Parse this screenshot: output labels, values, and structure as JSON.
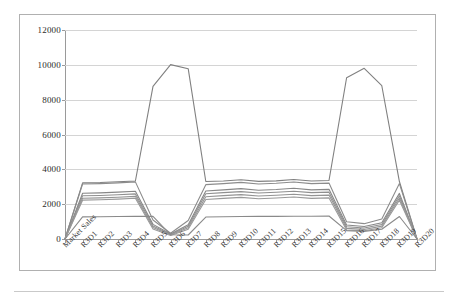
{
  "chart_data": {
    "type": "line",
    "title": "",
    "xlabel": "",
    "ylabel": "",
    "ylim": [
      0,
      12000
    ],
    "y_ticks": [
      0,
      2000,
      4000,
      6000,
      8000,
      10000,
      12000
    ],
    "grid": true,
    "legend": "none",
    "categories": [
      "Market Sales",
      "R3D1",
      "R3D2",
      "R3D3",
      "R3D4",
      "R3D5",
      "R3D6",
      "R3D7",
      "R3D8",
      "R3D9",
      "R3D10",
      "R3D11",
      "R3D12",
      "R3D13",
      "R3D14",
      "R3D15",
      "R3D16",
      "R3D17",
      "R3D18",
      "R3D19",
      "R3D20"
    ],
    "series": [
      {
        "name": "Series 1",
        "color": "#808080",
        "values": [
          0,
          3220,
          3240,
          3290,
          3330,
          8760,
          10010,
          9780,
          3300,
          3330,
          3400,
          3310,
          3340,
          3420,
          3330,
          3360,
          9260,
          9800,
          8800,
          3300,
          0
        ]
      },
      {
        "name": "Series 2",
        "color": "#8c8c8c",
        "values": [
          0,
          3160,
          3180,
          3220,
          3280,
          1090,
          330,
          1060,
          3120,
          3180,
          3250,
          3160,
          3200,
          3270,
          3180,
          3210,
          990,
          880,
          1150,
          3180,
          0
        ]
      },
      {
        "name": "Series 3",
        "color": "#878787",
        "values": [
          0,
          2630,
          2650,
          2690,
          2740,
          840,
          290,
          820,
          2760,
          2820,
          2890,
          2800,
          2840,
          2910,
          2820,
          2850,
          800,
          720,
          930,
          2620,
          0
        ]
      },
      {
        "name": "Series 4",
        "color": "#8f8f8f",
        "values": [
          0,
          2480,
          2500,
          2540,
          2590,
          750,
          260,
          730,
          2600,
          2660,
          2720,
          2640,
          2680,
          2740,
          2660,
          2690,
          700,
          630,
          830,
          2480,
          0
        ]
      },
      {
        "name": "Series 5",
        "color": "#949494",
        "values": [
          0,
          2340,
          2360,
          2400,
          2450,
          660,
          230,
          650,
          2430,
          2490,
          2550,
          2470,
          2510,
          2570,
          2490,
          2520,
          610,
          550,
          740,
          2350,
          0
        ]
      },
      {
        "name": "Series 6",
        "color": "#999999",
        "values": [
          0,
          2230,
          2250,
          2290,
          2340,
          570,
          200,
          560,
          2270,
          2330,
          2390,
          2310,
          2350,
          2410,
          2330,
          2360,
          520,
          470,
          650,
          2230,
          0
        ]
      },
      {
        "name": "Series 7",
        "color": "#8a8a8a",
        "values": [
          0,
          1270,
          1280,
          1290,
          1300,
          1300,
          240,
          230,
          1260,
          1280,
          1290,
          1300,
          1300,
          1310,
          1310,
          1320,
          480,
          440,
          560,
          1290,
          0
        ]
      }
    ]
  },
  "axis": {
    "y_tick_labels": [
      "12000",
      "10000",
      "8000",
      "6000",
      "4000",
      "2000",
      "0"
    ]
  }
}
